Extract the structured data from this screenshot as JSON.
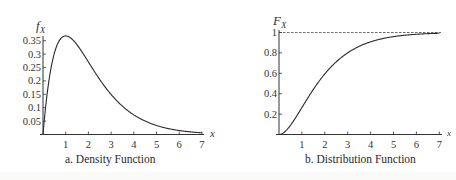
{
  "chart_data": [
    {
      "type": "line",
      "title": "a. Density Function",
      "xlabel": "x",
      "ylabel": "f_X",
      "xlim": [
        0,
        7
      ],
      "ylim": [
        0,
        0.37
      ],
      "x_ticks": [
        1,
        2,
        3,
        4,
        5,
        6,
        7
      ],
      "y_ticks": [
        0.05,
        0.1,
        0.15,
        0.2,
        0.25,
        0.3,
        0.35
      ],
      "grid": false,
      "legend": null,
      "function": "f(x) = x e^(-x)",
      "series": [
        {
          "name": "f_X",
          "x": [
            0,
            0.25,
            0.5,
            0.75,
            1,
            1.5,
            2,
            2.5,
            3,
            3.5,
            4,
            4.5,
            5,
            5.5,
            6,
            6.5,
            7
          ],
          "values": [
            0,
            0.195,
            0.303,
            0.354,
            0.368,
            0.335,
            0.271,
            0.205,
            0.149,
            0.106,
            0.073,
            0.05,
            0.034,
            0.022,
            0.015,
            0.01,
            0.006
          ]
        }
      ]
    },
    {
      "type": "line",
      "title": "b. Distribution Function",
      "xlabel": "x",
      "ylabel": "F_X",
      "xlim": [
        0,
        7
      ],
      "ylim": [
        0,
        1
      ],
      "x_ticks": [
        1,
        2,
        3,
        4,
        5,
        6,
        7
      ],
      "y_ticks": [
        0.2,
        0.4,
        0.6,
        0.8,
        1
      ],
      "grid": false,
      "legend": null,
      "annotations": [
        "dashed horizontal asymptote at y = 1"
      ],
      "function": "F(x) = 1 - (1 + x) e^(-x)",
      "series": [
        {
          "name": "F_X",
          "x": [
            0,
            0.25,
            0.5,
            0.75,
            1,
            1.5,
            2,
            2.5,
            3,
            3.5,
            4,
            4.5,
            5,
            5.5,
            6,
            6.5,
            7
          ],
          "values": [
            0,
            0.026,
            0.09,
            0.173,
            0.264,
            0.442,
            0.594,
            0.713,
            0.801,
            0.864,
            0.908,
            0.939,
            0.96,
            0.973,
            0.983,
            0.989,
            0.993
          ]
        }
      ]
    }
  ],
  "left": {
    "ylabel_main": "f",
    "ylabel_sub": "X",
    "xlabel": "x",
    "caption": "a. Density Function",
    "x_tick_labels": [
      "1",
      "2",
      "3",
      "4",
      "5",
      "6",
      "7"
    ],
    "y_tick_labels": [
      "0.05",
      "0.1",
      "0.15",
      "0.2",
      "0.25",
      "0.3",
      "0.35"
    ]
  },
  "right": {
    "ylabel_main": "F",
    "ylabel_sub": "X",
    "xlabel": "x",
    "caption": "b. Distribution Function",
    "x_tick_labels": [
      "1",
      "2",
      "3",
      "4",
      "5",
      "6",
      "7"
    ],
    "y_tick_labels": [
      "0.2",
      "0.4",
      "0.6",
      "0.8",
      "1"
    ]
  },
  "colors": {
    "line": "#2a2a2a",
    "axis": "#333333",
    "background": "#ffffff"
  }
}
